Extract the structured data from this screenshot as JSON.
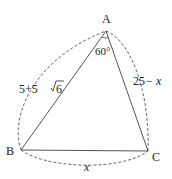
{
  "diagram": {
    "type": "triangle",
    "vertices": [
      {
        "id": "A",
        "label": "A"
      },
      {
        "id": "B",
        "label": "B"
      },
      {
        "id": "C",
        "label": "C"
      }
    ],
    "angle_A": "60°",
    "sides": {
      "AB": {
        "label_main": "5+5",
        "label_root": "6"
      },
      "AC": {
        "label_num": "25",
        "label_minus": "−",
        "label_var": "x"
      },
      "BC": {
        "label_var": "x"
      }
    },
    "colors": {
      "line": "#444444",
      "text": "#222222"
    }
  }
}
